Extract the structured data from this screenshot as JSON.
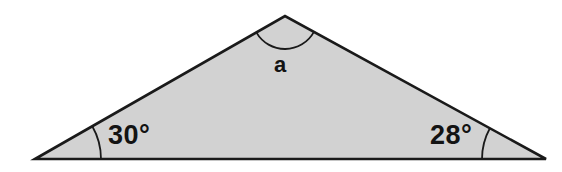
{
  "figure": {
    "type": "triangle-angle-diagram",
    "background_color": "#ffffff",
    "fill_color": "#d2d2d2",
    "stroke_color": "#1a1a1a",
    "text_color": "#131313"
  },
  "vertices": {
    "left": {
      "x": 35,
      "y": 159
    },
    "apex": {
      "x": 285,
      "y": 16
    },
    "right": {
      "x": 546,
      "y": 159
    }
  },
  "labels": {
    "left_angle": "30°",
    "right_angle": "28°",
    "apex_angle": "a"
  },
  "angle_marks": [
    {
      "name": "left-angle-arc",
      "vertex": "left",
      "radius": 66
    },
    {
      "name": "right-angle-arc",
      "vertex": "right",
      "radius": 64
    },
    {
      "name": "apex-angle-arc",
      "vertex": "apex",
      "radius": 33
    }
  ],
  "chart_data": {
    "type": "diagram",
    "title": "",
    "shape": "triangle",
    "angles": [
      {
        "label": "30°",
        "value": 30,
        "position": "bottom-left"
      },
      {
        "label": "28°",
        "value": 28,
        "position": "bottom-right"
      },
      {
        "label": "a",
        "value": null,
        "position": "apex"
      }
    ]
  }
}
